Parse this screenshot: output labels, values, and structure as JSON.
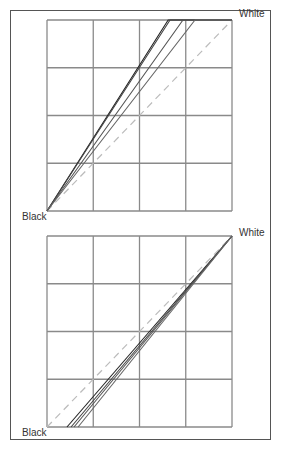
{
  "charts": [
    {
      "type": "line",
      "label_black": "Black",
      "label_white": "White",
      "grid": {
        "x0": 47,
        "y0": 20,
        "x1": 232,
        "y1": 211,
        "divisions": 4
      },
      "reference_dashed": [
        [
          0,
          0
        ],
        [
          1,
          1
        ]
      ],
      "series": [
        {
          "points": [
            [
              0,
              0
            ],
            [
              0.655,
              1
            ],
            [
              1,
              1
            ]
          ],
          "color": "#222222"
        },
        {
          "points": [
            [
              0,
              0
            ],
            [
              0.665,
              1
            ],
            [
              1,
              1
            ]
          ],
          "color": "#444444"
        },
        {
          "points": [
            [
              0,
              0
            ],
            [
              0.735,
              1
            ],
            [
              1,
              1
            ]
          ],
          "color": "#555555"
        },
        {
          "points": [
            [
              0,
              0
            ],
            [
              0.8,
              1
            ],
            [
              1,
              1
            ]
          ],
          "color": "#666666"
        }
      ]
    },
    {
      "type": "line",
      "label_black": "Black",
      "label_white": "White",
      "grid": {
        "x0": 47,
        "y0": 236,
        "x1": 232,
        "y1": 427,
        "divisions": 4
      },
      "reference_dashed": [
        [
          0,
          0
        ],
        [
          1,
          1
        ]
      ],
      "series": [
        {
          "points": [
            [
              0.108,
              0
            ],
            [
              1,
              1
            ]
          ],
          "color": "#222222"
        },
        {
          "points": [
            [
              0.13,
              0
            ],
            [
              1,
              1
            ]
          ],
          "color": "#444444"
        },
        {
          "points": [
            [
              0.146,
              0
            ],
            [
              1,
              1
            ]
          ],
          "color": "#555555"
        },
        {
          "points": [
            [
              0.168,
              0
            ],
            [
              1,
              1
            ]
          ],
          "color": "#666666"
        }
      ]
    }
  ],
  "chart_data": [
    {
      "type": "line",
      "title": "",
      "xlabel": "",
      "ylabel": "",
      "annotations": [
        "Black",
        "White"
      ],
      "xlim": [
        0,
        1
      ],
      "ylim": [
        0,
        1
      ],
      "grid": true,
      "series": [
        {
          "name": "reference (dashed)",
          "x": [
            0,
            1
          ],
          "y": [
            0,
            1
          ]
        },
        {
          "name": "curve 1",
          "x": [
            0,
            0.655,
            1
          ],
          "y": [
            0,
            1,
            1
          ]
        },
        {
          "name": "curve 2",
          "x": [
            0,
            0.665,
            1
          ],
          "y": [
            0,
            1,
            1
          ]
        },
        {
          "name": "curve 3",
          "x": [
            0,
            0.735,
            1
          ],
          "y": [
            0,
            1,
            1
          ]
        },
        {
          "name": "curve 4",
          "x": [
            0,
            0.8,
            1
          ],
          "y": [
            0,
            1,
            1
          ]
        }
      ]
    },
    {
      "type": "line",
      "title": "",
      "xlabel": "",
      "ylabel": "",
      "annotations": [
        "Black",
        "White"
      ],
      "xlim": [
        0,
        1
      ],
      "ylim": [
        0,
        1
      ],
      "grid": true,
      "series": [
        {
          "name": "reference (dashed)",
          "x": [
            0,
            1
          ],
          "y": [
            0,
            1
          ]
        },
        {
          "name": "curve 1",
          "x": [
            0.108,
            1
          ],
          "y": [
            0,
            1
          ]
        },
        {
          "name": "curve 2",
          "x": [
            0.13,
            1
          ],
          "y": [
            0,
            1
          ]
        },
        {
          "name": "curve 3",
          "x": [
            0.146,
            1
          ],
          "y": [
            0,
            1
          ]
        },
        {
          "name": "curve 4",
          "x": [
            0.168,
            1
          ],
          "y": [
            0,
            1
          ]
        }
      ]
    }
  ]
}
